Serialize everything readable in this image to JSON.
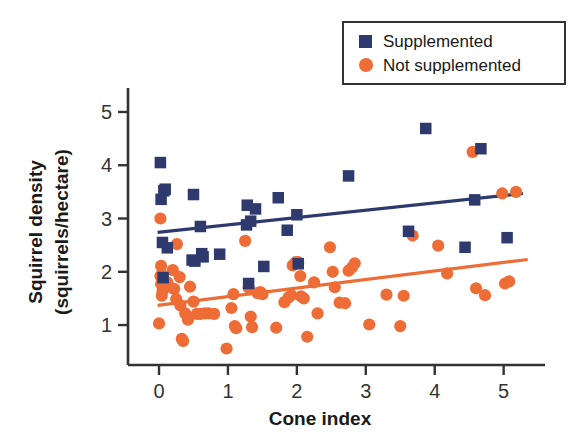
{
  "chart_data": {
    "type": "scatter",
    "title": "",
    "xlabel": "Cone index",
    "ylabel": "Squirrel density (squirrels/hectare)",
    "ylabel_line1": "Squirrel density",
    "ylabel_line2": "(squirrels/hectare)",
    "xlim": [
      -0.45,
      5.6
    ],
    "ylim": [
      0.25,
      5.45
    ],
    "xticks": [
      0,
      1,
      2,
      3,
      4,
      5
    ],
    "yticks": [
      1,
      2,
      3,
      4,
      5
    ],
    "xtick_labels": [
      "0",
      "1",
      "2",
      "3",
      "4",
      "5"
    ],
    "ytick_labels": [
      "1",
      "2",
      "3",
      "4",
      "5"
    ],
    "grid": false,
    "legend_position": "top-right",
    "colors": {
      "supplemented": "#2e3a6e",
      "not_supplemented": "#ee6c35",
      "axis": "#333333",
      "text": "#1a1a1a",
      "background": "#ffffff"
    },
    "series": [
      {
        "name": "Supplemented",
        "marker": "square",
        "color": "#2e3a6e",
        "points": [
          [
            0.02,
            4.05
          ],
          [
            0.03,
            3.36
          ],
          [
            0.07,
            3.52
          ],
          [
            0.09,
            3.55
          ],
          [
            0.05,
            2.55
          ],
          [
            0.12,
            2.45
          ],
          [
            0.06,
            1.89
          ],
          [
            0.5,
            3.45
          ],
          [
            0.48,
            2.22
          ],
          [
            0.52,
            2.2
          ],
          [
            0.6,
            2.85
          ],
          [
            0.62,
            2.34
          ],
          [
            0.64,
            2.28
          ],
          [
            0.88,
            2.33
          ],
          [
            1.28,
            3.25
          ],
          [
            1.27,
            2.88
          ],
          [
            1.33,
            2.95
          ],
          [
            1.4,
            3.18
          ],
          [
            1.3,
            1.78
          ],
          [
            1.52,
            2.1
          ],
          [
            1.73,
            3.39
          ],
          [
            1.86,
            2.78
          ],
          [
            2.0,
            3.07
          ],
          [
            2.02,
            2.15
          ],
          [
            2.75,
            3.8
          ],
          [
            3.62,
            2.76
          ],
          [
            3.87,
            4.69
          ],
          [
            4.44,
            2.46
          ],
          [
            4.58,
            3.35
          ],
          [
            4.67,
            4.31
          ],
          [
            5.05,
            2.64
          ]
        ]
      },
      {
        "name": "Not supplemented",
        "marker": "circle",
        "color": "#ee6c35",
        "points": [
          [
            0.02,
            3.0
          ],
          [
            0.03,
            2.11
          ],
          [
            0.04,
            1.95
          ],
          [
            0.02,
            1.92
          ],
          [
            0.03,
            1.77
          ],
          [
            0.05,
            1.64
          ],
          [
            0.04,
            1.55
          ],
          [
            0.0,
            1.03
          ],
          [
            0.12,
            1.8
          ],
          [
            0.15,
            1.72
          ],
          [
            0.2,
            2.03
          ],
          [
            0.22,
            1.68
          ],
          [
            0.25,
            1.49
          ],
          [
            0.26,
            2.52
          ],
          [
            0.3,
            1.9
          ],
          [
            0.31,
            1.37
          ],
          [
            0.33,
            0.74
          ],
          [
            0.35,
            0.7
          ],
          [
            0.38,
            1.22
          ],
          [
            0.42,
            1.1
          ],
          [
            0.45,
            1.72
          ],
          [
            0.5,
            1.44
          ],
          [
            0.55,
            1.21
          ],
          [
            0.6,
            1.21
          ],
          [
            0.66,
            1.22
          ],
          [
            0.72,
            1.22
          ],
          [
            0.8,
            1.21
          ],
          [
            0.98,
            0.56
          ],
          [
            1.05,
            1.32
          ],
          [
            1.08,
            1.58
          ],
          [
            1.1,
            0.98
          ],
          [
            1.12,
            0.94
          ],
          [
            1.25,
            2.58
          ],
          [
            1.3,
            1.7
          ],
          [
            1.33,
            1.16
          ],
          [
            1.35,
            0.96
          ],
          [
            1.43,
            1.6
          ],
          [
            1.47,
            1.62
          ],
          [
            1.5,
            1.58
          ],
          [
            1.7,
            0.95
          ],
          [
            1.82,
            1.43
          ],
          [
            1.88,
            1.52
          ],
          [
            1.92,
            1.56
          ],
          [
            1.94,
            2.12
          ],
          [
            1.98,
            2.18
          ],
          [
            2.02,
            2.18
          ],
          [
            2.05,
            1.92
          ],
          [
            2.06,
            1.54
          ],
          [
            2.1,
            1.5
          ],
          [
            2.15,
            0.78
          ],
          [
            2.25,
            1.8
          ],
          [
            2.3,
            1.22
          ],
          [
            2.48,
            2.46
          ],
          [
            2.52,
            2.0
          ],
          [
            2.55,
            1.71
          ],
          [
            2.62,
            1.42
          ],
          [
            2.7,
            1.41
          ],
          [
            2.75,
            2.02
          ],
          [
            2.8,
            2.08
          ],
          [
            2.84,
            2.16
          ],
          [
            3.05,
            1.01
          ],
          [
            3.3,
            1.57
          ],
          [
            3.5,
            0.98
          ],
          [
            3.55,
            1.55
          ],
          [
            3.68,
            2.68
          ],
          [
            4.05,
            2.49
          ],
          [
            4.18,
            1.97
          ],
          [
            4.55,
            4.25
          ],
          [
            4.6,
            1.69
          ],
          [
            4.73,
            1.56
          ],
          [
            4.98,
            3.47
          ],
          [
            5.02,
            1.78
          ],
          [
            5.08,
            1.82
          ],
          [
            5.18,
            3.5
          ]
        ]
      }
    ],
    "trend_lines": [
      {
        "name": "Supplemented trend",
        "color": "#2e3a6e",
        "x0": -0.02,
        "y0": 2.74,
        "x1": 5.28,
        "y1": 3.47
      },
      {
        "name": "Not supplemented trend",
        "color": "#ee6c35",
        "x0": -0.02,
        "y0": 1.37,
        "x1": 5.35,
        "y1": 2.23
      }
    ],
    "legend": [
      {
        "label": "Supplemented",
        "marker": "square",
        "color": "#2e3a6e"
      },
      {
        "label": "Not supplemented",
        "marker": "circle",
        "color": "#ee6c35"
      }
    ]
  }
}
